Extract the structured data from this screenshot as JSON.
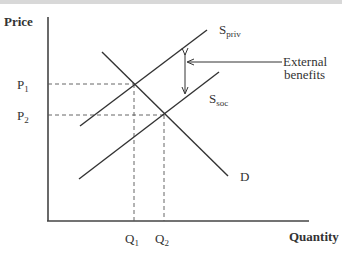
{
  "diagram": {
    "y_axis_label": "Price",
    "x_axis_label": "Quantity",
    "price_labels": [
      {
        "main": "P",
        "sub": "1"
      },
      {
        "main": "P",
        "sub": "2"
      }
    ],
    "quantity_labels": [
      {
        "main": "Q",
        "sub": "1"
      },
      {
        "main": "Q",
        "sub": "2"
      }
    ],
    "curves": {
      "s_priv": {
        "main": "S",
        "sub": "priv"
      },
      "s_soc": {
        "main": "S",
        "sub": "soc"
      },
      "demand": "D"
    },
    "annotation": {
      "line1": "External",
      "line2": "benefits"
    },
    "colors": {
      "line": "#333333",
      "dashed": "#555555",
      "text": "#333333"
    }
  }
}
